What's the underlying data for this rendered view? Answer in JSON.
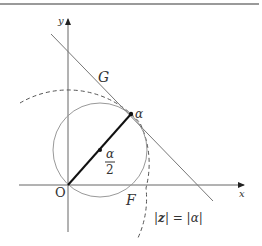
{
  "diagram": {
    "type": "complex-plane-geometry",
    "axes": {
      "x_label": "x",
      "y_label": "y",
      "origin_label": "O"
    },
    "points": {
      "alpha": {
        "label": "α"
      },
      "half_alpha": {
        "numerator": "α",
        "denominator": "2"
      }
    },
    "curves": {
      "tangent_line": {
        "label": "G"
      },
      "small_circle": {
        "label": "F"
      },
      "dashed_circle": {
        "label_left": "|",
        "label_var": "z",
        "label_mid": "| = |",
        "label_right_var": "α",
        "label_end": "|"
      }
    },
    "colors": {
      "axis": "#555555",
      "curve": "#888888",
      "segment": "#111111",
      "rule": "#9a9a9a"
    }
  }
}
